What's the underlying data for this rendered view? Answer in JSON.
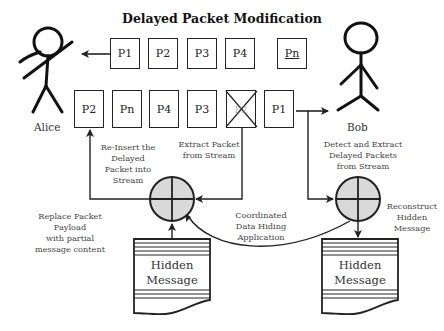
{
  "title": "Delayed Packet Modification",
  "actors": {
    "sender": "Alice",
    "receiver": "Bob"
  },
  "top_stream": {
    "direction": "toward Alice",
    "packets": [
      "P1",
      "P2",
      "P3",
      "P4",
      "Pn"
    ]
  },
  "bottom_stream": {
    "direction": "toward Bob",
    "packets": [
      "P2",
      "Pn",
      "P4",
      "P3",
      "P2 (extracted)",
      "P1"
    ]
  },
  "labels": {
    "reinsert": [
      "Re-Insert the",
      "Delayed",
      "Packet into",
      "Stream"
    ],
    "extract": [
      "Extract Packet",
      "from Stream"
    ],
    "detect": [
      "Detect and Extract",
      "Delayed Packets",
      "from Stream"
    ],
    "replace": [
      "Replace Packet",
      "Payload",
      "with partial",
      "message content"
    ],
    "coordinated": [
      "Coordinated",
      "Data Hiding",
      "Application"
    ],
    "reconstruct": [
      "Reconstruct",
      "Hidden",
      "Message"
    ]
  },
  "documents": {
    "left": [
      "Hidden",
      "Message"
    ],
    "right": [
      "Hidden",
      "Message"
    ]
  },
  "colors": {
    "line": "#222222",
    "circle_fill": "#d9d9d9",
    "text": "#333333"
  }
}
